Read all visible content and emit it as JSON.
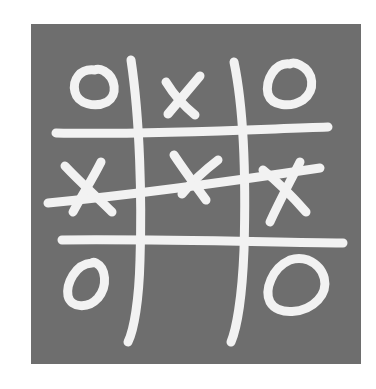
{
  "game": {
    "title": "Tic-tac-toe",
    "board_color": "#6e6e6e",
    "mark_color": "#f2f2f2",
    "cells": [
      [
        "O",
        "X",
        "O"
      ],
      [
        "X",
        "X",
        "X"
      ],
      [
        "O",
        "",
        "O"
      ]
    ],
    "winning_line": "middle-row",
    "winner": "X"
  }
}
